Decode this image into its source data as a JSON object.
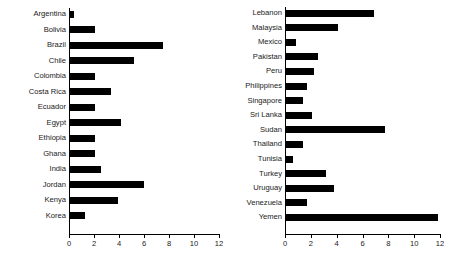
{
  "chart_data": [
    {
      "type": "bar",
      "orientation": "horizontal",
      "title": "",
      "xlabel": "",
      "ylabel": "",
      "xlim": [
        0,
        12
      ],
      "xticks": [
        0,
        2,
        4,
        6,
        8,
        10,
        12
      ],
      "xtick_labels": [
        "0",
        "2",
        "4",
        "6",
        "8",
        "10",
        "12"
      ],
      "grid": false,
      "legend": false,
      "categories": [
        "Argentina",
        "Bolivia",
        "Brazil",
        "Chile",
        "Colombia",
        "Costa Rica",
        "Ecuador",
        "Egypt",
        "Ethiopia",
        "Ghana",
        "India",
        "Jordan",
        "Kenya",
        "Korea"
      ],
      "values": [
        0.35,
        2.0,
        7.4,
        5.1,
        2.0,
        3.3,
        2.0,
        4.1,
        2.0,
        2.0,
        2.5,
        5.9,
        3.8,
        1.2
      ]
    },
    {
      "type": "bar",
      "orientation": "horizontal",
      "title": "",
      "xlabel": "",
      "ylabel": "",
      "xlim": [
        0,
        12
      ],
      "xticks": [
        0,
        2,
        4,
        6,
        8,
        10,
        12
      ],
      "xtick_labels": [
        "0",
        "2",
        "4",
        "6",
        "8",
        "10",
        "12"
      ],
      "grid": false,
      "legend": false,
      "categories": [
        "Lebanon",
        "Malaysia",
        "Mexico",
        "Pakistan",
        "Peru",
        "Philippines",
        "Singapore",
        "Sri Lanka",
        "Sudan",
        "Thailand",
        "Tunisia",
        "Turkey",
        "Uruguay",
        "Venezuela",
        "Yemen"
      ],
      "values": [
        6.8,
        4.0,
        0.8,
        2.5,
        2.2,
        1.6,
        1.3,
        2.0,
        7.7,
        1.3,
        0.55,
        3.1,
        3.7,
        1.6,
        11.8
      ]
    }
  ],
  "style": {
    "bar_color": "#000000",
    "axis_color": "#000000",
    "text_color": "#1a1a1a",
    "background": "#ffffff"
  }
}
